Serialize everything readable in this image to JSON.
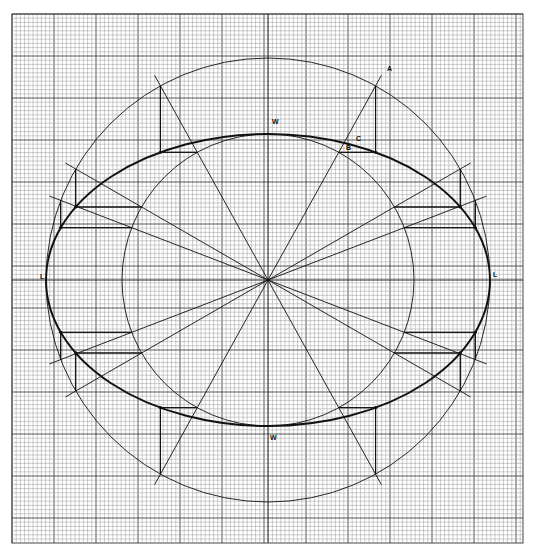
{
  "diagram": {
    "title": "",
    "type": "ellipse construction on graph paper (concentric circle method)",
    "colors": {
      "paper": "#ffffff",
      "grid_minor": "#9a9a9a",
      "grid_major": "#444444",
      "ink": "#111111"
    },
    "grid": {
      "x0": 12,
      "y0": 14,
      "x1": 523,
      "y1": 543,
      "minor": 4.2,
      "major_every": 10
    },
    "center": {
      "x": 268,
      "y": 280
    },
    "outer_circle_r": 222,
    "inner_circle_r": 146,
    "ellipse": {
      "rx": 222,
      "ry": 146
    },
    "spoke_angles_deg": [
      21,
      30,
      61,
      90,
      119,
      150,
      159
    ],
    "labels": [
      {
        "id": "A",
        "text": "A",
        "x": 387,
        "y": 71
      },
      {
        "id": "B",
        "text": "B",
        "x": 346,
        "y": 150
      },
      {
        "id": "C",
        "text": "C",
        "x": 356,
        "y": 141
      },
      {
        "id": "W-top",
        "text": "W",
        "x": 272,
        "y": 124
      },
      {
        "id": "W-bottom",
        "text": "W",
        "x": 270,
        "y": 440
      },
      {
        "id": "L-left",
        "text": "L",
        "x": 40,
        "y": 279
      },
      {
        "id": "L-right",
        "text": "L",
        "x": 493,
        "y": 277
      }
    ]
  }
}
